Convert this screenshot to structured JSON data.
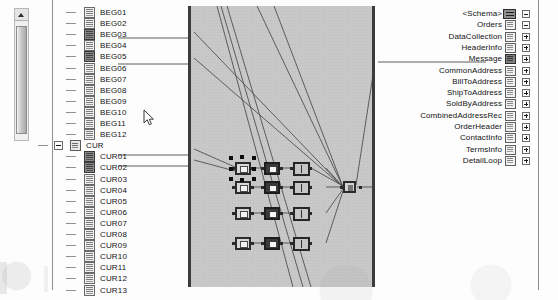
{
  "app": {
    "title": "Schema Mapper",
    "canvas_background": "#c8c8c8",
    "accent": "#3b3b3b"
  },
  "left_scrollbar": {
    "name": "source-tree-scrollbar",
    "up_arrow": "scroll-up",
    "thumb_position": "top"
  },
  "source_tree": {
    "nodes": [
      {
        "label": "BEG01",
        "icon": "field-icon",
        "mapped": false,
        "depth": 1
      },
      {
        "label": "BEG02",
        "icon": "field-icon",
        "mapped": false,
        "depth": 1
      },
      {
        "label": "BEG03",
        "icon": "field-mapped-icon",
        "mapped": true,
        "depth": 1
      },
      {
        "label": "BEG04",
        "icon": "field-icon",
        "mapped": false,
        "depth": 1
      },
      {
        "label": "BEG05",
        "icon": "field-mapped-icon",
        "mapped": true,
        "depth": 1
      },
      {
        "label": "BEG06",
        "icon": "field-icon",
        "mapped": false,
        "depth": 1
      },
      {
        "label": "BEG07",
        "icon": "field-icon",
        "mapped": false,
        "depth": 1
      },
      {
        "label": "BEG08",
        "icon": "field-icon",
        "mapped": false,
        "depth": 1
      },
      {
        "label": "BEG09",
        "icon": "field-icon",
        "mapped": false,
        "depth": 1
      },
      {
        "label": "BEG10",
        "icon": "field-icon",
        "mapped": false,
        "depth": 1
      },
      {
        "label": "BEG11",
        "icon": "field-icon",
        "mapped": false,
        "depth": 1
      },
      {
        "label": "BEG12",
        "icon": "field-icon",
        "mapped": false,
        "depth": 1
      },
      {
        "label": "CUR",
        "icon": "folder-icon",
        "mapped": false,
        "depth": 0,
        "expander": "collapse"
      },
      {
        "label": "CUR01",
        "icon": "field-mapped-icon",
        "mapped": true,
        "depth": 1
      },
      {
        "label": "CUR02",
        "icon": "field-mapped-icon",
        "mapped": true,
        "depth": 1
      },
      {
        "label": "CUR03",
        "icon": "field-icon",
        "mapped": false,
        "depth": 1
      },
      {
        "label": "CUR04",
        "icon": "field-icon",
        "mapped": false,
        "depth": 1
      },
      {
        "label": "CUR05",
        "icon": "field-icon",
        "mapped": false,
        "depth": 1
      },
      {
        "label": "CUR06",
        "icon": "field-icon",
        "mapped": false,
        "depth": 1
      },
      {
        "label": "CUR07",
        "icon": "field-icon",
        "mapped": false,
        "depth": 1
      },
      {
        "label": "CUR08",
        "icon": "field-icon",
        "mapped": false,
        "depth": 1
      },
      {
        "label": "CUR09",
        "icon": "field-icon",
        "mapped": false,
        "depth": 1
      },
      {
        "label": "CUR10",
        "icon": "field-icon",
        "mapped": false,
        "depth": 1
      },
      {
        "label": "CUR11",
        "icon": "field-icon",
        "mapped": false,
        "depth": 1
      },
      {
        "label": "CUR12",
        "icon": "field-icon",
        "mapped": false,
        "depth": 1
      },
      {
        "label": "CUR13",
        "icon": "field-icon",
        "mapped": false,
        "depth": 1
      }
    ]
  },
  "target_tree": {
    "nodes": [
      {
        "label": "<Schema>",
        "icon": "schema-icon",
        "mapped": false,
        "toggle": "collapse"
      },
      {
        "label": "Orders",
        "icon": "node-icon",
        "mapped": false,
        "toggle": "collapse"
      },
      {
        "label": "DataCollection",
        "icon": "node-icon",
        "mapped": false,
        "toggle": "expand"
      },
      {
        "label": "HeaderInfo",
        "icon": "node-icon",
        "mapped": false,
        "toggle": "expand"
      },
      {
        "label": "Message",
        "icon": "node-mapped-icon",
        "mapped": true,
        "toggle": "expand"
      },
      {
        "label": "CommonAddress",
        "icon": "node-icon",
        "mapped": false,
        "toggle": "expand"
      },
      {
        "label": "BillToAddress",
        "icon": "node-icon",
        "mapped": false,
        "toggle": "expand"
      },
      {
        "label": "ShipToAddress",
        "icon": "node-icon",
        "mapped": false,
        "toggle": "expand"
      },
      {
        "label": "SoldByAddress",
        "icon": "node-icon",
        "mapped": false,
        "toggle": "expand"
      },
      {
        "label": "CombinedAddressRec",
        "icon": "node-icon",
        "mapped": false,
        "toggle": "expand"
      },
      {
        "label": "OrderHeader",
        "icon": "node-icon",
        "mapped": false,
        "toggle": "expand"
      },
      {
        "label": "ContactInfo",
        "icon": "node-icon",
        "mapped": false,
        "toggle": "expand"
      },
      {
        "label": "TermsInfo",
        "icon": "node-icon",
        "mapped": false,
        "toggle": "expand"
      },
      {
        "label": "DetailLoop",
        "icon": "node-icon",
        "mapped": false,
        "toggle": "expand"
      }
    ]
  },
  "canvas": {
    "name": "mapping-canvas",
    "nodes": [
      {
        "id": "n1",
        "kind": "selected-functoid",
        "row": 1,
        "col": 1,
        "selected": true
      },
      {
        "id": "n2",
        "kind": "dark-functoid",
        "row": 1,
        "col": 2,
        "selected": false
      },
      {
        "id": "n3",
        "kind": "grid-functoid",
        "row": 1,
        "col": 3,
        "selected": false
      },
      {
        "id": "n4",
        "kind": "light-functoid",
        "row": 2,
        "col": 1,
        "selected": false
      },
      {
        "id": "n5",
        "kind": "dark-functoid",
        "row": 2,
        "col": 2,
        "selected": false
      },
      {
        "id": "n6",
        "kind": "grid-functoid",
        "row": 2,
        "col": 3,
        "selected": false
      },
      {
        "id": "n7",
        "kind": "light-functoid",
        "row": 3,
        "col": 1,
        "selected": false
      },
      {
        "id": "n8",
        "kind": "dark-functoid",
        "row": 3,
        "col": 2,
        "selected": false
      },
      {
        "id": "n9",
        "kind": "grid-functoid",
        "row": 3,
        "col": 3,
        "selected": false
      },
      {
        "id": "n10",
        "kind": "light-functoid",
        "row": 4,
        "col": 1,
        "selected": false
      },
      {
        "id": "n11",
        "kind": "dark-functoid",
        "row": 4,
        "col": 2,
        "selected": false
      },
      {
        "id": "n12",
        "kind": "grid-functoid",
        "row": 4,
        "col": 3,
        "selected": false
      },
      {
        "id": "n13",
        "kind": "merge-functoid",
        "row": 2,
        "col": 4,
        "selected": false
      }
    ]
  },
  "cursor": {
    "name": "mouse-pointer",
    "x": 143,
    "y": 109
  }
}
